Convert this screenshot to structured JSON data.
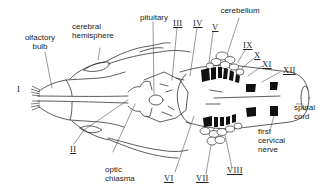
{
  "diagram": {
    "labels": {
      "olfactory_bulb": "olfactory\nbulb",
      "cerebral_hemisphere": "cerebral\nhemisphere",
      "pituitary": "pituitary",
      "cerebellum": "cerebellum",
      "spinal_cord": "spinal\ncord",
      "first_cervical_nerve": "first\ncervical\nnerve",
      "optic_chiasma": "optic\nchiasma"
    },
    "cranial_nerves": {
      "I": "I",
      "II": "II",
      "III": "III",
      "IV": "IV",
      "V": "V",
      "VI": "VI",
      "VII": "VII",
      "VIII": "VIII",
      "IX": "IX",
      "X": "X",
      "XI": "XI",
      "XII": "XII"
    },
    "colors": {
      "ink": "#222222",
      "fill": "#111111",
      "background": "#ffffff"
    }
  }
}
